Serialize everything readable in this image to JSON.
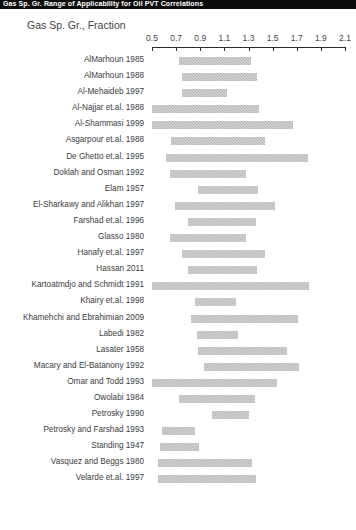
{
  "topbar": {
    "text": "Gas Sp. Gr. Range of Applicability for Oil PVT Correlations"
  },
  "chart_data": {
    "type": "bar",
    "orientation": "horizontal-range",
    "title": "Gas Sp. Gr., Fraction",
    "xlabel": "Gas Sp. Gr., Fraction",
    "ylabel": "",
    "xlim": [
      0.5,
      2.1
    ],
    "xticks": [
      "0.5",
      "0.7",
      "0.9",
      "1.1",
      "1.3",
      "1.5",
      "1.7",
      "1.9",
      "2.1"
    ],
    "xtick_values": [
      0.5,
      0.7,
      0.9,
      1.1,
      1.3,
      1.5,
      1.7,
      1.9,
      2.1
    ],
    "grid": false,
    "legend": false,
    "bar_color": "#b6b6b6",
    "categories": [
      "AlMarhoun 1985",
      "AlMarhoun 1988",
      "Al-Mehaideb 1997",
      "Al-Najjar et.al. 1988",
      "Al-Shammasi 1999",
      "Asgarpour et.al. 1988",
      "De Ghetto et.al. 1995",
      "Doklah and Osman 1992",
      "Elam 1957",
      "El-Sharkawy and Alikhan 1997",
      "Farshad et.al. 1996",
      "Glasso 1980",
      "Hanafy et.al. 1997",
      "Hassan 2011",
      "Kartoatmdjo and Schmidt 1991",
      "Khairy et.al. 1998",
      "Khamehchi and Ebrahimian 2009",
      "Labedi 1982",
      "Lasater 1958",
      "Macary and El-Batanony 1992",
      "Omar and Todd 1993",
      "Owolabi 1984",
      "Petrosky 1990",
      "Petrosky and Farshad 1993",
      "Standing 1947",
      "Vasquez and Beggs 1980",
      "Velarde et.al. 1997"
    ],
    "ranges": [
      [
        0.72,
        1.32
      ],
      [
        0.75,
        1.37
      ],
      [
        0.75,
        1.12
      ],
      [
        0.5,
        1.39
      ],
      [
        0.5,
        1.67
      ],
      [
        0.66,
        1.44
      ],
      [
        0.62,
        1.79
      ],
      [
        0.65,
        1.28
      ],
      [
        0.88,
        1.38
      ],
      [
        0.69,
        1.52
      ],
      [
        0.8,
        1.36
      ],
      [
        0.65,
        1.28
      ],
      [
        0.75,
        1.44
      ],
      [
        0.8,
        1.37
      ],
      [
        0.5,
        1.8
      ],
      [
        0.86,
        1.2
      ],
      [
        0.82,
        1.71
      ],
      [
        0.87,
        1.21
      ],
      [
        0.88,
        1.62
      ],
      [
        0.93,
        1.72
      ],
      [
        0.5,
        1.54
      ],
      [
        0.72,
        1.35
      ],
      [
        1.0,
        1.3
      ],
      [
        0.58,
        0.86
      ],
      [
        0.57,
        0.89
      ],
      [
        0.55,
        1.33
      ],
      [
        0.55,
        1.36
      ]
    ]
  }
}
